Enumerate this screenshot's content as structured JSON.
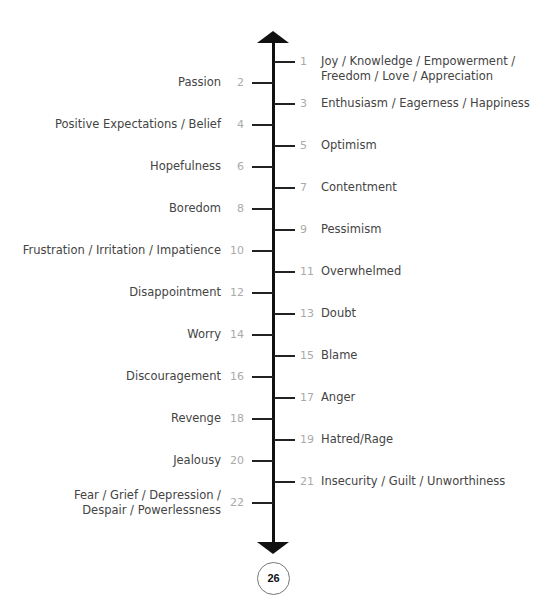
{
  "scale": {
    "items": [
      {
        "n": "1",
        "side": "right",
        "label": "Joy / Knowledge / Empowerment /\nFreedom / Love / Appreciation"
      },
      {
        "n": "2",
        "side": "left",
        "label": "Passion"
      },
      {
        "n": "3",
        "side": "right",
        "label": "Enthusiasm / Eagerness / Happiness"
      },
      {
        "n": "4",
        "side": "left",
        "label": "Positive Expectations / Belief"
      },
      {
        "n": "5",
        "side": "right",
        "label": "Optimism"
      },
      {
        "n": "6",
        "side": "left",
        "label": "Hopefulness"
      },
      {
        "n": "7",
        "side": "right",
        "label": "Contentment"
      },
      {
        "n": "8",
        "side": "left",
        "label": "Boredom"
      },
      {
        "n": "9",
        "side": "right",
        "label": "Pessimism"
      },
      {
        "n": "10",
        "side": "left",
        "label": "Frustration / Irritation / Impatience"
      },
      {
        "n": "11",
        "side": "right",
        "label": "Overwhelmed"
      },
      {
        "n": "12",
        "side": "left",
        "label": "Disappointment"
      },
      {
        "n": "13",
        "side": "right",
        "label": "Doubt"
      },
      {
        "n": "14",
        "side": "left",
        "label": "Worry"
      },
      {
        "n": "15",
        "side": "right",
        "label": "Blame"
      },
      {
        "n": "16",
        "side": "left",
        "label": "Discouragement"
      },
      {
        "n": "17",
        "side": "right",
        "label": "Anger"
      },
      {
        "n": "18",
        "side": "left",
        "label": "Revenge"
      },
      {
        "n": "19",
        "side": "right",
        "label": "Hatred/Rage"
      },
      {
        "n": "20",
        "side": "left",
        "label": "Jealousy"
      },
      {
        "n": "21",
        "side": "right",
        "label": "Insecurity / Guilt / Unworthiness"
      },
      {
        "n": "22",
        "side": "left",
        "label": "Fear / Grief / Depression /\nDespair / Powerlessness"
      }
    ]
  },
  "page_number": "26"
}
